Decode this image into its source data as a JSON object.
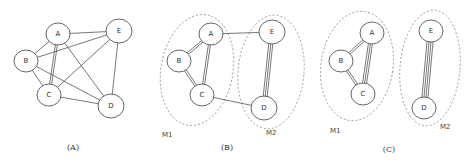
{
  "panels": [
    {
      "id": "A",
      "caption": "(A)",
      "caption_pos": [
        73,
        150
      ],
      "nodes": [
        {
          "id": "A",
          "label": "A",
          "x": 58,
          "y": 34,
          "r": 11
        },
        {
          "id": "B",
          "label": "B",
          "x": 26,
          "y": 61,
          "r": 11
        },
        {
          "id": "C",
          "label": "C",
          "x": 49,
          "y": 95,
          "r": 11
        },
        {
          "id": "D",
          "label": "D",
          "x": 111,
          "y": 106,
          "r": 12
        },
        {
          "id": "E",
          "label": "E",
          "x": 119,
          "y": 31,
          "r": 12
        }
      ],
      "edges": [
        {
          "from": "A",
          "to": "B",
          "multiplicity": 1
        },
        {
          "from": "A",
          "to": "E",
          "multiplicity": 1
        },
        {
          "from": "A",
          "to": "C",
          "multiplicity": 2
        },
        {
          "from": "A",
          "to": "D",
          "multiplicity": 1
        },
        {
          "from": "B",
          "to": "E",
          "multiplicity": 1
        },
        {
          "from": "B",
          "to": "C",
          "multiplicity": 1
        },
        {
          "from": "B",
          "to": "D",
          "multiplicity": 1
        },
        {
          "from": "C",
          "to": "E",
          "multiplicity": 1
        },
        {
          "from": "C",
          "to": "D",
          "multiplicity": 1
        },
        {
          "from": "E",
          "to": "D",
          "multiplicity": 1
        }
      ],
      "modules": []
    },
    {
      "id": "B",
      "caption": "(B)",
      "caption_pos": [
        227,
        150
      ],
      "nodes": [
        {
          "id": "A",
          "label": "A",
          "x": 211,
          "y": 34,
          "r": 11
        },
        {
          "id": "B",
          "label": "B",
          "x": 179,
          "y": 61,
          "r": 11
        },
        {
          "id": "C",
          "label": "C",
          "x": 202,
          "y": 95,
          "r": 11
        },
        {
          "id": "D",
          "label": "D",
          "x": 264,
          "y": 108,
          "r": 12
        },
        {
          "id": "E",
          "label": "E",
          "x": 272,
          "y": 32,
          "r": 12
        }
      ],
      "edges": [
        {
          "from": "A",
          "to": "B",
          "multiplicity": 2
        },
        {
          "from": "A",
          "to": "C",
          "multiplicity": 2
        },
        {
          "from": "B",
          "to": "C",
          "multiplicity": 2
        },
        {
          "from": "A",
          "to": "E",
          "multiplicity": 1
        },
        {
          "from": "C",
          "to": "D",
          "multiplicity": 1
        },
        {
          "from": "E",
          "to": "D",
          "multiplicity": 3
        }
      ],
      "modules": [
        {
          "label": "M1",
          "cx": 197,
          "cy": 70,
          "rx": 36,
          "ry": 56,
          "rot": 10,
          "label_x": 162,
          "label_y": 137
        },
        {
          "label": "M2",
          "cx": 271,
          "cy": 72,
          "rx": 33,
          "ry": 57,
          "rot": 5,
          "label_x": 266,
          "label_y": 135
        }
      ]
    },
    {
      "id": "C",
      "caption": "(C)",
      "caption_pos": [
        389,
        152
      ],
      "nodes": [
        {
          "id": "A",
          "label": "A",
          "x": 372,
          "y": 33,
          "r": 11
        },
        {
          "id": "B",
          "label": "B",
          "x": 341,
          "y": 61,
          "r": 11
        },
        {
          "id": "C",
          "label": "C",
          "x": 363,
          "y": 94,
          "r": 11
        },
        {
          "id": "D",
          "label": "D",
          "x": 424,
          "y": 108,
          "r": 11
        },
        {
          "id": "E",
          "label": "E",
          "x": 431,
          "y": 31,
          "r": 11
        }
      ],
      "edges": [
        {
          "from": "A",
          "to": "B",
          "multiplicity": 2
        },
        {
          "from": "A",
          "to": "C",
          "multiplicity": 3
        },
        {
          "from": "B",
          "to": "C",
          "multiplicity": 2
        },
        {
          "from": "E",
          "to": "D",
          "multiplicity": 4
        }
      ],
      "modules": [
        {
          "label": "M1",
          "cx": 357,
          "cy": 66,
          "rx": 36,
          "ry": 55,
          "rot": 8,
          "label_x": 330,
          "label_y": 133
        },
        {
          "label": "M2",
          "cx": 430,
          "cy": 68,
          "rx": 30,
          "ry": 58,
          "rot": 5,
          "label_x": 440,
          "label_y": 129
        }
      ]
    }
  ]
}
